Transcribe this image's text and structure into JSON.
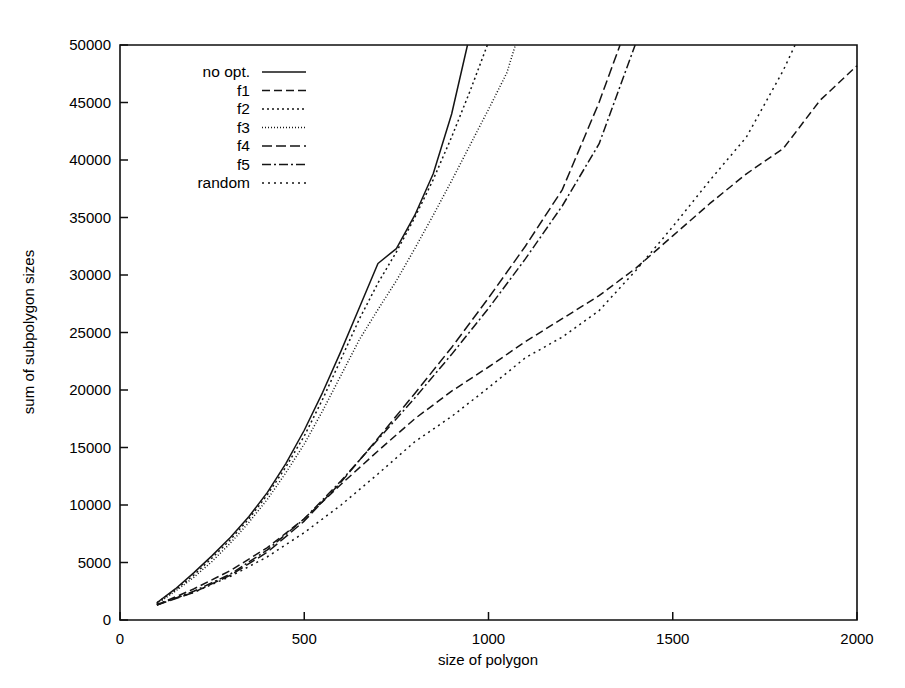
{
  "chart_data": {
    "type": "line",
    "title": "",
    "xlabel": "size of polygon",
    "ylabel": "sum of subpolygon sizes",
    "xlim": [
      0,
      2000
    ],
    "ylim": [
      0,
      50000
    ],
    "xticks": [
      0,
      500,
      1000,
      1500,
      2000
    ],
    "xtick_labels": [
      "0",
      "500",
      "1000",
      "1500",
      "2000"
    ],
    "yticks": [
      0,
      5000,
      10000,
      15000,
      20000,
      25000,
      30000,
      35000,
      40000,
      45000,
      50000
    ],
    "ytick_labels": [
      "0",
      "5000",
      "10000",
      "15000",
      "20000",
      "25000",
      "30000",
      "35000",
      "40000",
      "45000",
      "50000"
    ],
    "grid": false,
    "legend_position": "top-left",
    "series": [
      {
        "name": "no opt.",
        "style": "solid",
        "dash": "none",
        "x": [
          100,
          150,
          200,
          250,
          300,
          350,
          400,
          450,
          500,
          550,
          600,
          650,
          700,
          750,
          800,
          850,
          900,
          943
        ],
        "y": [
          1500,
          2700,
          4100,
          5600,
          7200,
          9000,
          11100,
          13600,
          16500,
          19800,
          23400,
          27200,
          31000,
          32300,
          35200,
          38800,
          44000,
          50000
        ]
      },
      {
        "name": "f1",
        "style": "dashed",
        "dash": "8,4",
        "x": [
          100,
          200,
          300,
          400,
          500,
          600,
          700,
          800,
          900,
          1000,
          1100,
          1200,
          1300,
          1400,
          1500,
          1600,
          1700,
          1800,
          1900,
          2000
        ],
        "y": [
          1300,
          2700,
          4300,
          6300,
          8800,
          11800,
          14700,
          17500,
          19900,
          22000,
          24200,
          26200,
          28200,
          30600,
          33400,
          36200,
          38800,
          41000,
          45200,
          48200
        ]
      },
      {
        "name": "f2",
        "style": "dotted",
        "dash": "2,3",
        "x": [
          100,
          150,
          200,
          250,
          300,
          350,
          400,
          450,
          500,
          550,
          600,
          650,
          700,
          750,
          800,
          850,
          900,
          950,
          997
        ],
        "y": [
          1500,
          2600,
          3900,
          5400,
          7000,
          8800,
          10900,
          13300,
          16000,
          19200,
          22700,
          26200,
          29300,
          32000,
          35000,
          38300,
          42000,
          46000,
          50000
        ]
      },
      {
        "name": "f3",
        "style": "fine-dotted",
        "dash": "1,2",
        "x": [
          100,
          150,
          200,
          250,
          300,
          350,
          400,
          450,
          500,
          550,
          600,
          650,
          700,
          750,
          800,
          850,
          900,
          950,
          1000,
          1050,
          1073
        ],
        "y": [
          1400,
          2500,
          3700,
          5100,
          6700,
          8500,
          10500,
          12800,
          15300,
          18200,
          21300,
          24400,
          27000,
          29500,
          32300,
          35200,
          38200,
          41300,
          44400,
          47600,
          50000
        ]
      },
      {
        "name": "f4",
        "style": "long-dash",
        "dash": "10,4",
        "x": [
          100,
          200,
          300,
          400,
          500,
          600,
          700,
          800,
          900,
          1000,
          1100,
          1200,
          1300,
          1357
        ],
        "y": [
          1300,
          2400,
          3900,
          5900,
          8600,
          12000,
          15800,
          19700,
          23700,
          28000,
          32500,
          37400,
          45000,
          50000
        ]
      },
      {
        "name": "f5",
        "style": "dash-dot",
        "dash": "9,3,2,3",
        "x": [
          100,
          200,
          300,
          400,
          500,
          600,
          700,
          800,
          900,
          1000,
          1100,
          1200,
          1300,
          1398
        ],
        "y": [
          1300,
          2500,
          4000,
          6100,
          8800,
          12100,
          15700,
          19300,
          23100,
          27100,
          31400,
          36000,
          41400,
          50000
        ]
      },
      {
        "name": "random",
        "style": "dotted",
        "dash": "2,4",
        "x": [
          100,
          200,
          300,
          400,
          500,
          600,
          700,
          800,
          900,
          1000,
          1100,
          1200,
          1300,
          1400,
          1500,
          1600,
          1700,
          1800,
          1832
        ],
        "y": [
          1400,
          2400,
          3800,
          5500,
          7600,
          10000,
          12700,
          15500,
          17700,
          20200,
          22800,
          24600,
          26900,
          30400,
          34200,
          38200,
          42000,
          47800,
          50000
        ]
      }
    ]
  },
  "axes": {
    "x_title": "size of polygon",
    "y_title": "sum of subpolygon sizes"
  },
  "legend": {
    "entries": [
      {
        "label": "no opt."
      },
      {
        "label": "f1"
      },
      {
        "label": "f2"
      },
      {
        "label": "f3"
      },
      {
        "label": "f4"
      },
      {
        "label": "f5"
      },
      {
        "label": "random"
      }
    ]
  },
  "colors": {
    "ink": "#141414",
    "background": "#ffffff"
  }
}
